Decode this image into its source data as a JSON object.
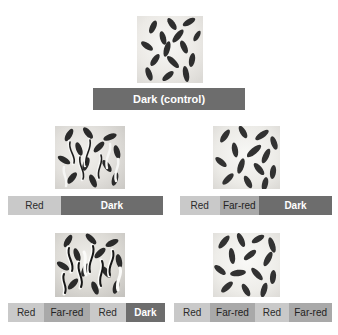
{
  "figure": {
    "top_cut_caption": "",
    "background_color": "#ffffff",
    "colors": {
      "red_segment": "#c9c9c9",
      "far_red_segment": "#a9a9a9",
      "dark_segment": "#6d6d6d",
      "dark_segment_text": "#ffffff",
      "light_segment_text": "#2b2b2b"
    }
  },
  "panels": [
    {
      "id": "control",
      "photo_alt": "petri-dish-of-ungerminated-lettuce-seeds",
      "germinated": false,
      "bar": {
        "segments": [
          {
            "label": "Dark (control)",
            "type": "dark"
          }
        ]
      }
    },
    {
      "id": "red",
      "photo_alt": "petri-dish-of-germinated-lettuce-seeds",
      "germinated": true,
      "bar": {
        "segments": [
          {
            "label": "Red",
            "type": "red"
          },
          {
            "label": "Dark",
            "type": "dark"
          }
        ]
      }
    },
    {
      "id": "red-farred",
      "photo_alt": "petri-dish-of-ungerminated-lettuce-seeds",
      "germinated": false,
      "bar": {
        "segments": [
          {
            "label": "Red",
            "type": "red"
          },
          {
            "label": "Far-red",
            "type": "farred"
          },
          {
            "label": "Dark",
            "type": "dark"
          }
        ]
      }
    },
    {
      "id": "red-farred-red",
      "photo_alt": "petri-dish-of-germinated-lettuce-seeds",
      "germinated": true,
      "bar": {
        "segments": [
          {
            "label": "Red",
            "type": "red"
          },
          {
            "label": "Far-red",
            "type": "farred"
          },
          {
            "label": "Red",
            "type": "red"
          },
          {
            "label": "Dark",
            "type": "dark"
          }
        ]
      }
    },
    {
      "id": "red-farred-red-farred",
      "photo_alt": "petri-dish-of-ungerminated-lettuce-seeds",
      "germinated": false,
      "bar": {
        "segments": [
          {
            "label": "Red",
            "type": "red"
          },
          {
            "label": "Far-red",
            "type": "farred"
          },
          {
            "label": "Red",
            "type": "red"
          },
          {
            "label": "Far-red",
            "type": "farred"
          }
        ]
      }
    }
  ],
  "labels": {
    "p0_s0": "Dark (control)",
    "p1_s0": "Red",
    "p1_s1": "Dark",
    "p2_s0": "Red",
    "p2_s1": "Far-red",
    "p2_s2": "Dark",
    "p3_s0": "Red",
    "p3_s1": "Far-red",
    "p3_s2": "Red",
    "p3_s3": "Dark",
    "p4_s0": "Red",
    "p4_s1": "Far-red",
    "p4_s2": "Red",
    "p4_s3": "Far-red"
  }
}
